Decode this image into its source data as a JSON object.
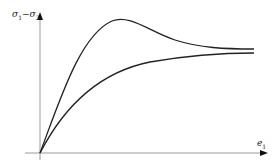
{
  "diagram": {
    "y_axis_label": {
      "main": "σ",
      "sub1": "1",
      "minus": "−σ",
      "sub2": "3"
    },
    "x_axis_label": {
      "main": "e",
      "sub": "1"
    },
    "curves": [
      {
        "name": "peak-curve",
        "description": "rises to a peak then softens to residual plateau"
      },
      {
        "name": "monotonic-curve",
        "description": "rises monotonically to plateau"
      }
    ],
    "colors": {
      "axis": "#888888",
      "curve": "#222222"
    }
  }
}
